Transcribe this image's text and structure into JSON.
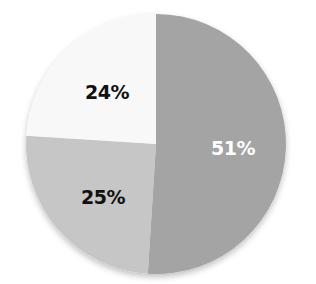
{
  "chart_data": {
    "type": "pie",
    "title": "",
    "start_angle_deg": 0,
    "direction": "clockwise",
    "center": [
      156,
      144
    ],
    "radius": 130,
    "slices": [
      {
        "label": "51%",
        "value": 51,
        "color": "#a4a4a4",
        "label_color": "#ffffff",
        "label_pos": [
          233,
          149
        ]
      },
      {
        "label": "25%",
        "value": 25,
        "color": "#c6c6c6",
        "label_color": "#111111",
        "label_pos": [
          103,
          198
        ]
      },
      {
        "label": "24%",
        "value": 24,
        "color": "#f8f8f8",
        "label_color": "#111111",
        "label_pos": [
          107,
          93
        ]
      }
    ],
    "legend": null,
    "shadow": true
  }
}
